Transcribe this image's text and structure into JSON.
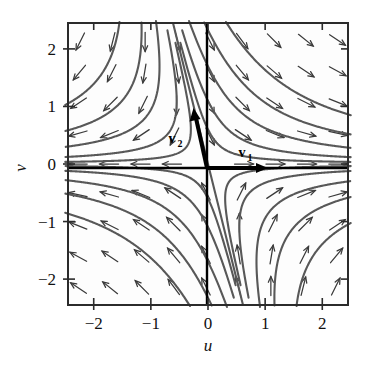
{
  "figure": {
    "background_color": "#ffffff",
    "frame_color": "#2b2b2b",
    "axis_color": "#000000",
    "trajectory_color": "#585858",
    "arrow_color": "#3a3a3a",
    "vector_color": "#000000"
  },
  "axes": {
    "x_name": "u",
    "y_name": "v",
    "x_ticks": [
      "-2",
      "-1",
      "0",
      "1",
      "2"
    ],
    "y_ticks": [
      "2",
      "1",
      "0",
      "-1",
      "-2"
    ]
  },
  "annotations": {
    "v1_label": "v",
    "v1_sub": "1",
    "v2_label": "v",
    "v2_sub": "2"
  },
  "chart_data": {
    "type": "scatter",
    "title": "",
    "subtitle": "",
    "xlabel": "u",
    "ylabel": "v",
    "xlim": [
      -2.45,
      2.45
    ],
    "ylim": [
      -2.45,
      2.45
    ],
    "xticks": [
      -2,
      -1,
      0,
      1,
      2
    ],
    "yticks": [
      -2,
      -1,
      0,
      1,
      2
    ],
    "xtick_labels": [
      "-2",
      "-1",
      "0",
      "1",
      "2"
    ],
    "ytick_labels": [
      "-2",
      "-1",
      "0",
      "1",
      "2"
    ],
    "grid": false,
    "legend": false,
    "legend_position": "none",
    "plot_kind": "phase-portrait-saddle",
    "equilibrium": {
      "u": 0,
      "v": 0,
      "type": "saddle"
    },
    "eigenvectors": [
      {
        "name": "v1",
        "label": "v₁",
        "u": 1.0,
        "v": 0.0,
        "drawn_length": 0.95,
        "arrow_tip": {
          "u": 0.95,
          "v": 0.0
        },
        "label_pos": {
          "u": 0.52,
          "v": 0.22
        },
        "stability": "unstable-outward"
      },
      {
        "name": "v2",
        "label": "v₂",
        "u": -0.25,
        "v": 1.0,
        "drawn_length": 1.0,
        "arrow_tip": {
          "u": -0.24,
          "v": 0.97
        },
        "label_pos": {
          "u": -0.3,
          "v": 0.46
        },
        "stability": "stable-inward"
      }
    ],
    "separatrices": [
      {
        "name": "u-axis",
        "description": "horizontal unstable manifold along v1"
      },
      {
        "name": "v2-line",
        "description": "oblique stable manifold along v2, slope about -4"
      }
    ],
    "trajectories_description": "Hyperbolic saddle orbits in all four quadrants; orbits approach along the v2 direction and depart along the v1 (u-axis) direction.",
    "vector_field_description": "Grid of unit direction arrows on a 9x9 lattice over u,v in [-2.2,2.2]; arrows point outward along u and inward along the v2 line.",
    "vector_field_grid": {
      "u_values": [
        -2.2,
        -1.65,
        -1.1,
        -0.55,
        0,
        0.55,
        1.1,
        1.65,
        2.2
      ],
      "v_values": [
        2.2,
        1.65,
        1.1,
        0.55,
        0,
        -0.55,
        -1.1,
        -1.65,
        -2.2
      ]
    }
  }
}
